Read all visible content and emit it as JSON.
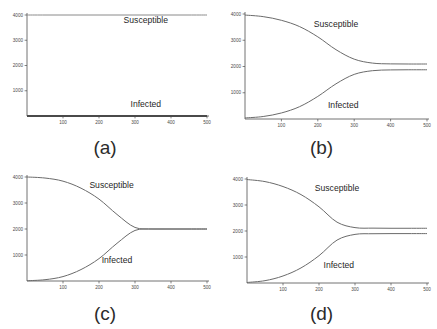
{
  "figure": {
    "background_color": "#ffffff",
    "curve_color": "#6b6b6b",
    "axis_color": "#4f4f4f",
    "text_color": "#1f1f1f"
  },
  "panels": [
    {
      "caption": "(a)",
      "series_labels": {
        "susceptible": "Susceptible",
        "infected": "Infected"
      },
      "label_pos": {
        "susceptible_x": 330,
        "susceptible_y": 3700,
        "infected_x": 330,
        "infected_y": 370
      }
    },
    {
      "caption": "(b)",
      "series_labels": {
        "susceptible": "Susceptible",
        "infected": "Infected"
      },
      "label_pos": {
        "susceptible_x": 250,
        "susceptible_y": 3500,
        "infected_x": 270,
        "infected_y": 430
      }
    },
    {
      "caption": "(c)",
      "series_labels": {
        "susceptible": "Susceptible",
        "infected": "Infected"
      },
      "label_pos": {
        "susceptible_x": 235,
        "susceptible_y": 3560,
        "infected_x": 250,
        "infected_y": 700
      }
    },
    {
      "caption": "(d)",
      "series_labels": {
        "susceptible": "Susceptible",
        "infected": "Infected"
      },
      "label_pos": {
        "susceptible_x": 250,
        "susceptible_y": 3540,
        "infected_x": 255,
        "infected_y": 560
      }
    }
  ],
  "chart_data": [
    {
      "type": "line",
      "title": "(a)",
      "xlabel": "",
      "ylabel": "",
      "xlim": [
        0,
        500
      ],
      "ylim": [
        0,
        4000
      ],
      "xticks": [
        100,
        200,
        300,
        400,
        500
      ],
      "yticks": [
        1000,
        2000,
        3000,
        4000
      ],
      "grid": false,
      "legend": "inline-annotations",
      "x": [
        0,
        50,
        100,
        150,
        200,
        250,
        300,
        350,
        400,
        450,
        500
      ],
      "series": [
        {
          "name": "Susceptible",
          "values": [
            4000,
            4000,
            4000,
            4000,
            4000,
            4000,
            4000,
            4000,
            4000,
            4000,
            4000
          ]
        },
        {
          "name": "Infected",
          "values": [
            0,
            0,
            0,
            0,
            0,
            0,
            0,
            0,
            0,
            0,
            0
          ]
        }
      ]
    },
    {
      "type": "line",
      "title": "(b)",
      "xlabel": "",
      "ylabel": "",
      "xlim": [
        0,
        500
      ],
      "ylim": [
        0,
        4000
      ],
      "xticks": [
        100,
        200,
        300,
        400,
        500
      ],
      "yticks": [
        1000,
        2000,
        3000,
        4000
      ],
      "grid": false,
      "legend": "inline-annotations",
      "x": [
        0,
        50,
        100,
        150,
        200,
        250,
        300,
        350,
        400,
        450,
        500
      ],
      "series": [
        {
          "name": "Susceptible",
          "values": [
            3960,
            3900,
            3760,
            3520,
            3130,
            2640,
            2280,
            2130,
            2100,
            2095,
            2095
          ]
        },
        {
          "name": "Infected",
          "values": [
            40,
            95,
            230,
            470,
            860,
            1340,
            1700,
            1840,
            1870,
            1875,
            1875
          ]
        }
      ]
    },
    {
      "type": "line",
      "title": "(c)",
      "xlabel": "",
      "ylabel": "",
      "xlim": [
        0,
        500
      ],
      "ylim": [
        0,
        4000
      ],
      "xticks": [
        100,
        200,
        300,
        400,
        500
      ],
      "yticks": [
        1000,
        2000,
        3000,
        4000
      ],
      "grid": false,
      "legend": "inline-annotations",
      "x": [
        0,
        50,
        100,
        150,
        200,
        250,
        300,
        350,
        400,
        450,
        500
      ],
      "series": [
        {
          "name": "Susceptible",
          "values": [
            4000,
            3960,
            3840,
            3570,
            3150,
            2560,
            2060,
            2000,
            2000,
            2000,
            2000
          ]
        },
        {
          "name": "Infected",
          "values": [
            10,
            50,
            170,
            440,
            860,
            1450,
            1945,
            2000,
            2000,
            2000,
            2000
          ]
        }
      ]
    },
    {
      "type": "line",
      "title": "(d)",
      "xlabel": "",
      "ylabel": "",
      "xlim": [
        0,
        500
      ],
      "ylim": [
        0,
        4000
      ],
      "xticks": [
        100,
        200,
        300,
        400,
        500
      ],
      "yticks": [
        1000,
        2000,
        3000,
        4000
      ],
      "grid": false,
      "legend": "inline-annotations",
      "x": [
        0,
        50,
        100,
        150,
        200,
        250,
        300,
        350,
        400,
        450,
        500
      ],
      "series": [
        {
          "name": "Susceptible",
          "values": [
            3980,
            3900,
            3710,
            3400,
            2930,
            2340,
            2130,
            2110,
            2105,
            2105,
            2105
          ]
        },
        {
          "name": "Infected",
          "values": [
            20,
            90,
            270,
            580,
            1050,
            1650,
            1870,
            1895,
            1900,
            1900,
            1900
          ]
        }
      ]
    }
  ]
}
